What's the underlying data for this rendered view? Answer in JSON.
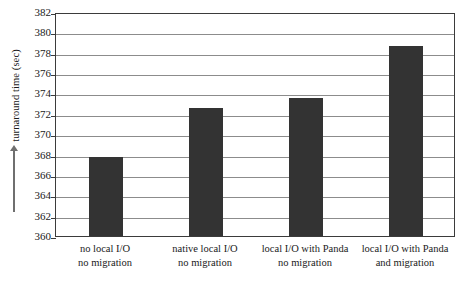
{
  "chart_data": {
    "type": "bar",
    "title": "",
    "subtitle": "",
    "xlabel": "",
    "ylabel": "turnaround time (sec)",
    "ylim": [
      360,
      382
    ],
    "ytick_step": 2,
    "yticks": [
      382,
      380,
      378,
      376,
      374,
      372,
      370,
      368,
      366,
      364,
      362,
      360
    ],
    "ytick_labels": [
      "382",
      "380",
      "378",
      "376",
      "374",
      "372",
      "370",
      "368",
      "366",
      "364",
      "362",
      "360"
    ],
    "grid": true,
    "grid_axis": "y",
    "legend": false,
    "legend_position": "none",
    "bar_color": "#333333",
    "axis_color": "#3b3b3b",
    "grid_color": "#8c8c8c",
    "background": "#ffffff",
    "categories": [
      "no local I/O\nno migration",
      "native local I/O\nno migration",
      "local I/O with Panda\nno migration",
      "local I/O with Panda\nand migration"
    ],
    "category_lines": [
      [
        "no local I/O",
        "no migration"
      ],
      [
        "native local I/O",
        "no migration"
      ],
      [
        "local I/O with Panda",
        "no migration"
      ],
      [
        "local I/O with Panda",
        "and migration"
      ]
    ],
    "values": [
      367.8,
      372.6,
      373.6,
      378.7
    ],
    "series": [
      {
        "name": "turnaround time",
        "values": [
          367.8,
          372.6,
          373.6,
          378.7
        ]
      }
    ]
  },
  "axis": {
    "y_title": "turnaround time (sec)",
    "y_arrow_icon": "up-arrow-icon"
  }
}
